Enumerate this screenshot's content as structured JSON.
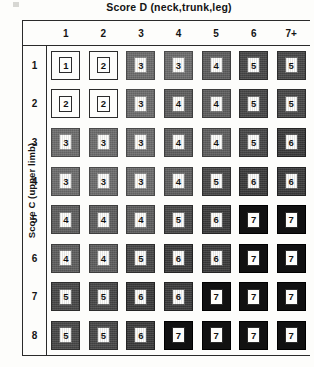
{
  "title": "Score D (neck,trunk,leg)",
  "y_axis_label": "Score C (upper limb)",
  "chart_data": {
    "type": "heatmap",
    "title": "Score D (neck,trunk,leg)",
    "xlabel": "Score D (neck,trunk,leg)",
    "ylabel": "Score C (upper limb)",
    "grid": true,
    "legend_position": "none",
    "x_tick_labels": [
      "1",
      "2",
      "3",
      "4",
      "5",
      "6",
      "7+"
    ],
    "y_tick_labels": [
      "1",
      "2",
      "3",
      "4",
      "5",
      "6",
      "7",
      "8"
    ],
    "categories": [
      "1",
      "2",
      "3",
      "4",
      "5",
      "6",
      "7+"
    ],
    "rows": [
      {
        "label": "1",
        "values": [
          1,
          2,
          3,
          3,
          4,
          5,
          5
        ]
      },
      {
        "label": "2",
        "values": [
          2,
          2,
          3,
          4,
          4,
          5,
          5
        ]
      },
      {
        "label": "3",
        "values": [
          3,
          3,
          3,
          4,
          4,
          5,
          6
        ]
      },
      {
        "label": "4",
        "values": [
          3,
          3,
          3,
          4,
          5,
          6,
          6
        ]
      },
      {
        "label": "5",
        "values": [
          4,
          4,
          4,
          5,
          6,
          7,
          7
        ]
      },
      {
        "label": "6",
        "values": [
          4,
          4,
          5,
          6,
          6,
          7,
          7
        ]
      },
      {
        "label": "7",
        "values": [
          5,
          5,
          6,
          6,
          7,
          7,
          7
        ]
      },
      {
        "label": "8",
        "values": [
          5,
          5,
          6,
          7,
          7,
          7,
          7
        ]
      }
    ],
    "value_range": [
      1,
      7
    ],
    "shading_colors": {
      "1": "#fdfdfb",
      "2": "#fdfdfb",
      "3": "#6d6d6d",
      "4": "#5e5e5e",
      "5": "#474747",
      "6": "#3a3a3a",
      "7": "#111111"
    }
  }
}
